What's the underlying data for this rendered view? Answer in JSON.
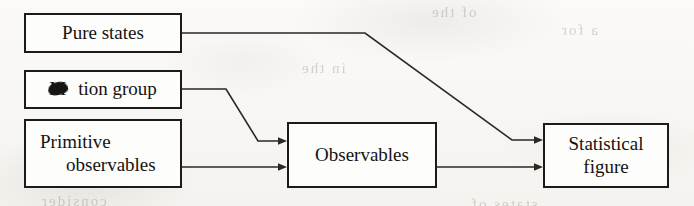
{
  "diagram": {
    "type": "flowchart",
    "title": "",
    "nodes": [
      {
        "id": "pure-states",
        "label": "Pure states",
        "line1": "Pure states",
        "line2": ""
      },
      {
        "id": "motion-group",
        "label": "Motion group",
        "line1": "M",
        "line2": "tion group"
      },
      {
        "id": "primitive",
        "label": "Primitive observables",
        "line1": "Primitive",
        "line2": "observables"
      },
      {
        "id": "observables",
        "label": "Observables",
        "line1": "Observables",
        "line2": ""
      },
      {
        "id": "statistical",
        "label": "Statistical figure",
        "line1": "Statistical",
        "line2": "figure"
      }
    ],
    "edges": [
      {
        "from": "pure-states",
        "to": "statistical",
        "arrow": true
      },
      {
        "from": "motion-group",
        "to": "observables",
        "arrow": true
      },
      {
        "from": "primitive",
        "to": "observables",
        "arrow": true
      },
      {
        "from": "observables",
        "to": "statistical",
        "arrow": true
      }
    ],
    "artifacts": {
      "ink_blotch_note": "ink blotch over the letter o in Motion",
      "showthrough": [
        "of the",
        "a for",
        "in the",
        "consider",
        "states of"
      ]
    },
    "colors": {
      "paper": "#f7f6f3",
      "ink": "#1d1b19",
      "box_fill": "#fdfdfb",
      "edge": "#2a2724"
    }
  }
}
